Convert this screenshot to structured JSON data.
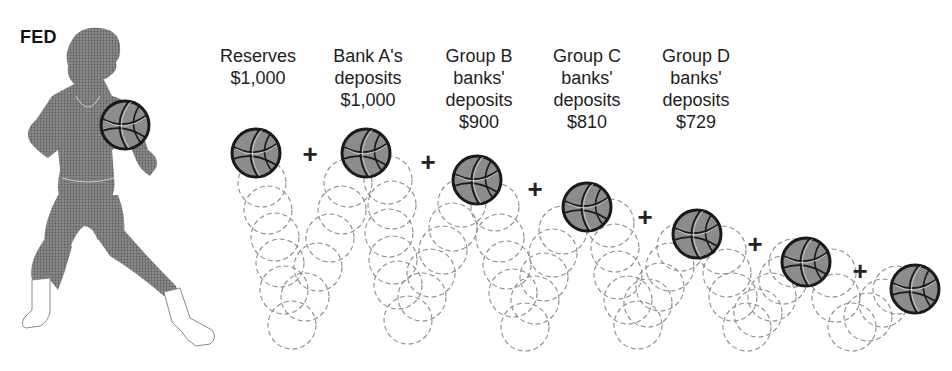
{
  "figure": {
    "label": "FED",
    "colors": {
      "silhouette": "#7a7a7a",
      "ball_fill": "#8a8a8a",
      "ball_stroke": "#1a1a1a",
      "dash_stroke": "#8c8c8c",
      "boots": "#ffffff"
    }
  },
  "columns": [
    {
      "lines": [
        "Reserves",
        "$1,000"
      ],
      "x": 258,
      "top": 45
    },
    {
      "lines": [
        "Bank A's",
        "deposits",
        "$1,000"
      ],
      "x": 368,
      "top": 45
    },
    {
      "lines": [
        "Group B",
        "banks'",
        "deposits",
        "$900"
      ],
      "x": 479,
      "top": 45
    },
    {
      "lines": [
        "Group C",
        "banks'",
        "deposits",
        "$810"
      ],
      "x": 587,
      "top": 45
    },
    {
      "lines": [
        "Group D",
        "banks'",
        "deposits",
        "$729"
      ],
      "x": 696,
      "top": 45
    }
  ],
  "plus_symbol": "+",
  "pluses": [
    {
      "x": 310,
      "y": 155
    },
    {
      "x": 428,
      "y": 163
    },
    {
      "x": 535,
      "y": 190
    },
    {
      "x": 645,
      "y": 218
    },
    {
      "x": 755,
      "y": 245
    },
    {
      "x": 860,
      "y": 272
    }
  ],
  "balls": [
    {
      "cx": 256,
      "cy": 153,
      "r": 25
    },
    {
      "cx": 366,
      "cy": 153,
      "r": 25
    },
    {
      "cx": 477,
      "cy": 180,
      "r": 25
    },
    {
      "cx": 587,
      "cy": 207,
      "r": 25
    },
    {
      "cx": 697,
      "cy": 234,
      "r": 25
    },
    {
      "cx": 806,
      "cy": 262,
      "r": 25
    },
    {
      "cx": 915,
      "cy": 289,
      "r": 25
    }
  ],
  "held_ball": {
    "cx": 125,
    "cy": 125,
    "r": 25
  },
  "trails": [
    [
      [
        262,
        183
      ],
      [
        268,
        210
      ],
      [
        275,
        237
      ],
      [
        280,
        263
      ],
      [
        284,
        290
      ],
      [
        292,
        325
      ],
      [
        305,
        297
      ],
      [
        318,
        267
      ],
      [
        330,
        238
      ],
      [
        342,
        210
      ],
      [
        348,
        183
      ]
    ],
    [
      [
        388,
        180
      ],
      [
        392,
        205
      ],
      [
        389,
        233
      ],
      [
        393,
        260
      ],
      [
        398,
        285
      ],
      [
        408,
        320
      ],
      [
        422,
        297
      ],
      [
        431,
        273
      ],
      [
        443,
        250
      ],
      [
        453,
        227
      ],
      [
        462,
        203
      ]
    ],
    [
      [
        495,
        207
      ],
      [
        500,
        238
      ],
      [
        507,
        265
      ],
      [
        513,
        293
      ],
      [
        525,
        327
      ],
      [
        535,
        300
      ],
      [
        544,
        277
      ],
      [
        553,
        253
      ],
      [
        563,
        230
      ]
    ],
    [
      [
        610,
        223
      ],
      [
        615,
        248
      ],
      [
        618,
        275
      ],
      [
        628,
        300
      ],
      [
        638,
        325
      ],
      [
        648,
        303
      ],
      [
        660,
        287
      ],
      [
        670,
        267
      ],
      [
        681,
        247
      ]
    ],
    [
      [
        722,
        250
      ],
      [
        727,
        273
      ],
      [
        733,
        297
      ],
      [
        747,
        327
      ],
      [
        758,
        313
      ],
      [
        772,
        297
      ],
      [
        783,
        280
      ],
      [
        793,
        263
      ]
    ],
    [
      [
        832,
        273
      ],
      [
        836,
        298
      ],
      [
        852,
        327
      ],
      [
        868,
        317
      ],
      [
        883,
        303
      ],
      [
        897,
        290
      ]
    ]
  ],
  "trail_radius": 24
}
